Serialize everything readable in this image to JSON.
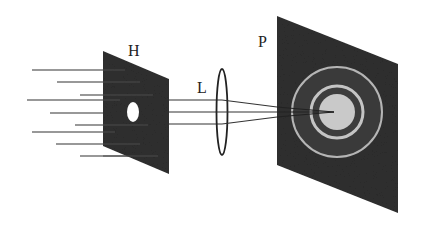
{
  "diagram": {
    "type": "optical-setup",
    "labels": {
      "hole_screen": "H",
      "lens": "L",
      "projection_screen": "P"
    },
    "elements": [
      {
        "id": "incoming-rays",
        "description": "parallel light rays arriving from the left"
      },
      {
        "id": "hole-screen",
        "label": "H",
        "description": "dark screen with a small circular aperture"
      },
      {
        "id": "lens",
        "label": "L",
        "description": "converging lens"
      },
      {
        "id": "projection-screen",
        "label": "P",
        "description": "screen showing Airy diffraction pattern (bright central disk with rings)"
      }
    ],
    "colors": {
      "background": "#ffffff",
      "screen": "#2e2e2e",
      "rays": "#333333",
      "central_disk": "#c9c9c9",
      "ring": "#b5b5b5",
      "hole": "#ffffff"
    }
  }
}
